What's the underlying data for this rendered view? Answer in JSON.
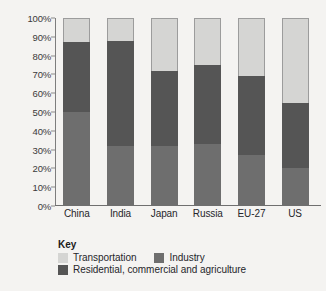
{
  "chart_data": {
    "type": "bar",
    "stacked": true,
    "title": "",
    "xlabel": "",
    "ylabel": "Share of 2007 energy consumption",
    "ylim": [
      0,
      100
    ],
    "ytick_labels": [
      "100%",
      "90%",
      "80%",
      "70%",
      "60%",
      "50%",
      "40%",
      "30%",
      "20%",
      "10%",
      "0%"
    ],
    "ytick_values": [
      100,
      90,
      80,
      70,
      60,
      50,
      40,
      30,
      20,
      10,
      0
    ],
    "grid": false,
    "legend_position": "bottom-left",
    "categories": [
      "China",
      "India",
      "Japan",
      "Russia",
      "EU-27",
      "US"
    ],
    "series": [
      {
        "name": "Industry",
        "color": "#6e6e6e",
        "values": [
          50,
          32,
          32,
          33,
          27,
          20
        ]
      },
      {
        "name": "Residential, commercial and agriculture",
        "color": "#555555",
        "values": [
          37,
          56,
          40,
          42,
          42,
          35
        ]
      },
      {
        "name": "Transportation",
        "color": "#d5d5d3",
        "values": [
          13,
          12,
          28,
          25,
          31,
          45
        ]
      }
    ],
    "cumulative_tops": {
      "China": [
        50,
        87,
        100
      ],
      "India": [
        32,
        88,
        100
      ],
      "Japan": [
        32,
        72,
        100
      ],
      "Russia": [
        33,
        75,
        100
      ],
      "EU-27": [
        27,
        69,
        100
      ],
      "US": [
        20,
        55,
        100
      ]
    }
  },
  "legend": {
    "title": "Key",
    "row1": [
      {
        "label": "Transportation",
        "color": "#d5d5d3"
      },
      {
        "label": "Industry",
        "color": "#6e6e6e"
      }
    ],
    "row2": [
      {
        "label": "Residential, commercial and agriculture",
        "color": "#555555"
      }
    ]
  }
}
